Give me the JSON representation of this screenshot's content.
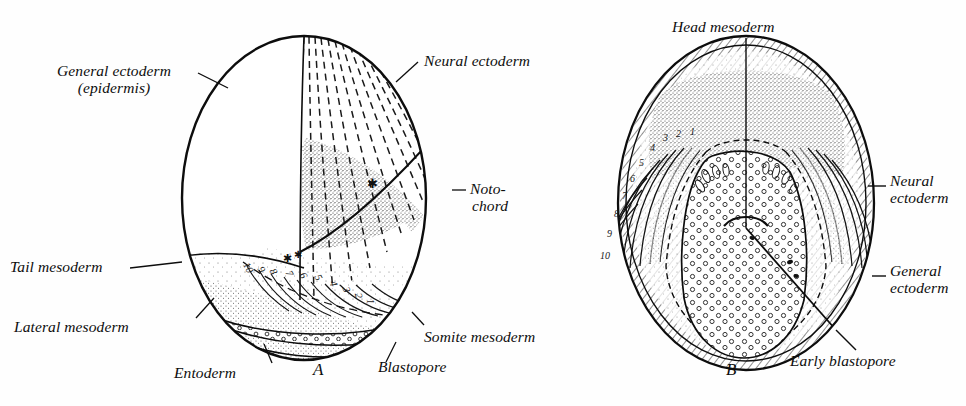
{
  "figure": {
    "background_color": "#fefefe",
    "ink_color": "#0d0d0d",
    "panels": [
      {
        "id": "A",
        "letter": "A"
      },
      {
        "id": "B",
        "letter": "B"
      }
    ]
  },
  "panel_a": {
    "letter": "A",
    "labels": {
      "general_ectoderm_line1": "General ectoderm",
      "general_ectoderm_line2": "(epidermis)",
      "neural_ectoderm": "Neural ectoderm",
      "notochord_line1": "Noto-",
      "notochord_line2": "chord",
      "tail_mesoderm": "Tail mesoderm",
      "lateral_mesoderm": "Lateral mesoderm",
      "entoderm": "Entoderm",
      "blastopore": "Blastopore",
      "somite_mesoderm": "Somite mesoderm"
    },
    "somite_numbers": [
      "10",
      "9",
      "8",
      "7",
      "6",
      "5",
      "4",
      "3",
      "2",
      "1"
    ]
  },
  "panel_b": {
    "letter": "B",
    "labels": {
      "head_mesoderm": "Head mesoderm",
      "neural_ectoderm_line1": "Neural",
      "neural_ectoderm_line2": "ectoderm",
      "general_ectoderm_line1": "General",
      "general_ectoderm_line2": "ectoderm",
      "early_blastopore": "Early blastopore"
    },
    "somite_numbers": [
      "1",
      "2",
      "3",
      "4",
      "5",
      "6",
      "7",
      "8",
      "9",
      "10"
    ]
  }
}
